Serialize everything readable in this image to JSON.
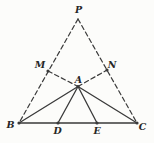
{
  "figure": {
    "background_color": "#fcfcfa",
    "stroke_color": "#3a3a3a",
    "label_color": "#262626",
    "label_font_size": 9.5,
    "dot_radius": 1.6,
    "solid_stroke_width": 1.3,
    "dashed_stroke_width": 1.2,
    "dash_pattern": "4.5 3",
    "points": {
      "P": {
        "x": 78,
        "y": 19,
        "dot": false
      },
      "M": {
        "x": 48,
        "y": 71,
        "dot": true
      },
      "N": {
        "x": 107,
        "y": 70,
        "dot": true
      },
      "A": {
        "x": 78,
        "y": 86.5,
        "dot": true
      },
      "B": {
        "x": 19,
        "y": 123,
        "dot": true
      },
      "D": {
        "x": 58,
        "y": 123,
        "dot": true
      },
      "E": {
        "x": 97,
        "y": 123,
        "dot": true
      },
      "C": {
        "x": 137,
        "y": 123,
        "dot": true
      }
    },
    "segments": [
      {
        "from": "P",
        "to": "B",
        "style": "dashed"
      },
      {
        "from": "P",
        "to": "C",
        "style": "dashed"
      },
      {
        "from": "M",
        "to": "A",
        "style": "dashed"
      },
      {
        "from": "A",
        "to": "N",
        "style": "dashed"
      },
      {
        "from": "B",
        "to": "C",
        "style": "solid"
      },
      {
        "from": "A",
        "to": "B",
        "style": "solid"
      },
      {
        "from": "A",
        "to": "D",
        "style": "solid"
      },
      {
        "from": "A",
        "to": "E",
        "style": "solid"
      },
      {
        "from": "A",
        "to": "C",
        "style": "solid"
      }
    ],
    "labels": [
      {
        "text": "P",
        "x": 78.5,
        "y": 12.5,
        "anchor": "middle"
      },
      {
        "text": "M",
        "x": 40,
        "y": 68,
        "anchor": "middle"
      },
      {
        "text": "N",
        "x": 112,
        "y": 67.5,
        "anchor": "middle"
      },
      {
        "text": "A",
        "x": 78.5,
        "y": 83,
        "anchor": "middle"
      },
      {
        "text": "B",
        "x": 10.5,
        "y": 127.5,
        "anchor": "middle"
      },
      {
        "text": "D",
        "x": 57.5,
        "y": 133.5,
        "anchor": "middle"
      },
      {
        "text": "E",
        "x": 97,
        "y": 133.5,
        "anchor": "middle"
      },
      {
        "text": "C",
        "x": 142.5,
        "y": 129.5,
        "anchor": "middle"
      }
    ]
  }
}
